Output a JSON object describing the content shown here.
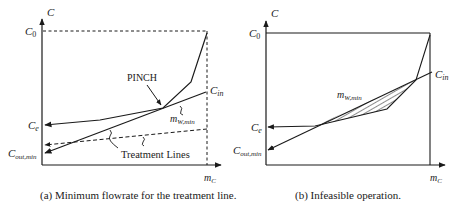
{
  "figure": {
    "panel_a": {
      "caption": "(a) Minimum flowrate for the treatment line.",
      "axis_y_label": "C",
      "axis_x_label": "m",
      "axis_x_sub": "C",
      "labels": {
        "c0": "C",
        "c0_sub": "0",
        "cin": "C",
        "cin_sub": "in",
        "ce": "C",
        "ce_sub": "e",
        "cout": "C",
        "cout_sub": "out,min",
        "pinch": "PINCH",
        "mw": "m",
        "mw_sub": "W,min",
        "treatment_lines": "Treatment Lines"
      }
    },
    "panel_b": {
      "caption": "(b) Infeasible operation.",
      "axis_y_label": "C",
      "axis_x_label": "m",
      "axis_x_sub": "C",
      "labels": {
        "c0": "C",
        "c0_sub": "0",
        "cin": "C",
        "cin_sub": "in",
        "ce": "C",
        "ce_sub": "e",
        "cout": "C",
        "cout_sub": "out,min",
        "mw": "m",
        "mw_sub": "W,min"
      }
    }
  }
}
